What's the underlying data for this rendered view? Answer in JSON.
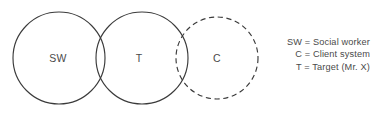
{
  "figure": {
    "background_color": "#ffffff",
    "stroke_color": "#3b3b3b",
    "text_color": "#4a4a4a"
  },
  "circles": [
    {
      "key": "sw",
      "label": "SW",
      "style": "solid",
      "cx": 59,
      "cy": 58,
      "r": 46
    },
    {
      "key": "t",
      "label": "T",
      "style": "solid",
      "cx": 142,
      "cy": 58,
      "r": 46
    },
    {
      "key": "c",
      "label": "C",
      "style": "dashed",
      "cx": 217,
      "cy": 58,
      "r": 41
    }
  ],
  "legend": {
    "lines": [
      "SW = Social worker",
      "C = Client system",
      "T = Target (Mr. X)"
    ]
  }
}
